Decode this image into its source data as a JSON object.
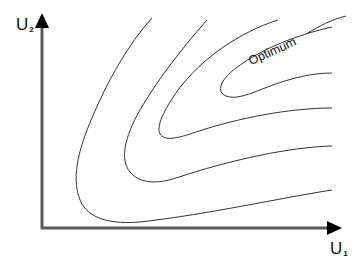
{
  "diagram": {
    "type": "contour-plot",
    "y_axis": {
      "label": "U",
      "subscript": "2"
    },
    "x_axis": {
      "label": "U",
      "subscript": "1"
    },
    "annotation": "Optimum",
    "contour_count": 5,
    "colors": {
      "line": "#333333",
      "axis": "#555555",
      "background": "#ffffff"
    }
  }
}
